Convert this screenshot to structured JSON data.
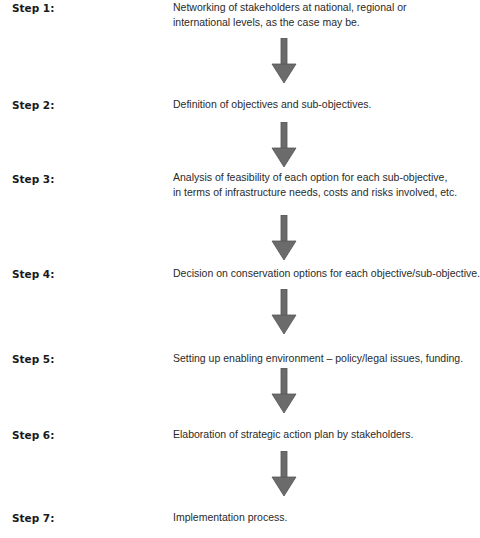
{
  "diagram": {
    "type": "flowchart",
    "direction": "top-to-bottom",
    "arrow_color": "#6b6b6b",
    "steps": [
      {
        "label": "Step 1:",
        "lines": [
          "Networking of stakeholders at national, regional or",
          "international levels, as the case may be."
        ]
      },
      {
        "label": "Step 2:",
        "lines": [
          "Definition of objectives and sub-objectives."
        ]
      },
      {
        "label": "Step 3:",
        "lines": [
          "Analysis of feasibility of each option for each sub-objective,",
          "in terms of infrastructure needs, costs and risks involved, etc."
        ]
      },
      {
        "label": "Step 4:",
        "lines": [
          "Decision on conservation options for each objective/sub-objective."
        ]
      },
      {
        "label": "Step 5:",
        "lines": [
          "Setting up enabling environment – policy/legal issues, funding."
        ]
      },
      {
        "label": "Step 6:",
        "lines": [
          "Elaboration of strategic action plan by stakeholders."
        ]
      },
      {
        "label": "Step 7:",
        "lines": [
          "Implementation process."
        ]
      }
    ]
  }
}
